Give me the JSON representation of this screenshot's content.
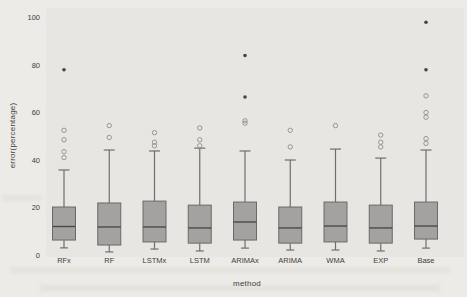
{
  "page": {
    "background_hex": "#ecebe7",
    "plot_panel_hex": "#e7e6e2"
  },
  "chart_data": {
    "type": "boxplot",
    "title": "",
    "xlabel": "method",
    "ylabel": "error(percentage)",
    "ylim": [
      0,
      100
    ],
    "yticks": [
      0,
      20,
      40,
      60,
      80,
      100
    ],
    "grid": false,
    "legend": "none",
    "categories": [
      "RFx",
      "RF",
      "LSTMx",
      "LSTM",
      "ARIMAx",
      "ARIMA",
      "WMA",
      "EXP",
      "Base"
    ],
    "boxes": [
      {
        "label": "RFx",
        "whisker_low": 3.0,
        "q1": 6.3,
        "median": 12.0,
        "q3": 20.2,
        "whisker_high": 35.8,
        "outliers_open": [
          52.5,
          48.5,
          43.5,
          41.0
        ],
        "outliers_filled": [
          78.0
        ]
      },
      {
        "label": "RF",
        "whisker_low": 1.3,
        "q1": 4.2,
        "median": 11.8,
        "q3": 21.9,
        "whisker_high": 44.2,
        "outliers_open": [
          54.5,
          49.5
        ],
        "outliers_filled": []
      },
      {
        "label": "LSTMx",
        "whisker_low": 2.5,
        "q1": 5.5,
        "median": 11.8,
        "q3": 22.7,
        "whisker_high": 43.8,
        "outliers_open": [
          51.5,
          47.5,
          46.0
        ],
        "outliers_filled": []
      },
      {
        "label": "LSTM",
        "whisker_low": 1.7,
        "q1": 5.0,
        "median": 11.4,
        "q3": 21.0,
        "whisker_high": 45.0,
        "outliers_open": [
          53.5,
          48.5,
          46.0
        ],
        "outliers_filled": []
      },
      {
        "label": "ARIMAx",
        "whisker_low": 2.9,
        "q1": 6.3,
        "median": 13.9,
        "q3": 22.3,
        "whisker_high": 43.8,
        "outliers_open": [
          56.5,
          55.5
        ],
        "outliers_filled": [
          84.0,
          66.5
        ]
      },
      {
        "label": "ARIMA",
        "whisker_low": 2.1,
        "q1": 5.0,
        "median": 11.4,
        "q3": 20.2,
        "whisker_high": 40.0,
        "outliers_open": [
          52.5,
          45.5
        ],
        "outliers_filled": []
      },
      {
        "label": "WMA",
        "whisker_low": 2.1,
        "q1": 5.5,
        "median": 12.2,
        "q3": 22.3,
        "whisker_high": 44.6,
        "outliers_open": [
          54.5
        ],
        "outliers_filled": []
      },
      {
        "label": "EXP",
        "whisker_low": 1.7,
        "q1": 5.0,
        "median": 11.4,
        "q3": 21.0,
        "whisker_high": 40.8,
        "outliers_open": [
          50.5,
          47.5,
          45.5
        ],
        "outliers_filled": []
      },
      {
        "label": "Base",
        "whisker_low": 2.9,
        "q1": 6.7,
        "median": 12.2,
        "q3": 22.3,
        "whisker_high": 44.2,
        "outliers_open": [
          67.0,
          60.0,
          58.0,
          49.0,
          47.0
        ],
        "outliers_filled": [
          98.0,
          78.0
        ]
      }
    ],
    "colors": {
      "box_fill": "#a3a2a0",
      "box_stroke": "#6b6a68",
      "median": "#4a4a48",
      "whisker": "#6f6e6c",
      "outlier_open": "#8e8d8a",
      "outlier_filled": "#454442",
      "text": "#3f3e3c"
    }
  }
}
